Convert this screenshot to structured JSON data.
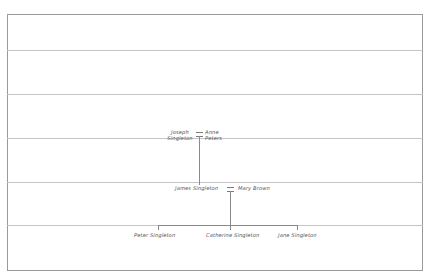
{
  "diagram": {
    "type": "family-tree",
    "generations": [
      {
        "level": 1,
        "couple": {
          "partner_a": {
            "line1": "Joseph",
            "line2": "Singleton",
            "full": "Joseph Singleton"
          },
          "partner_b": {
            "line1": "Anne",
            "line2": "Peters",
            "full": "Anne Peters"
          },
          "symbol": "="
        }
      },
      {
        "level": 2,
        "couple": {
          "partner_a": {
            "full": "James Singleton"
          },
          "partner_b": {
            "full": "Mary Brown"
          },
          "symbol": "="
        }
      },
      {
        "level": 3,
        "children": [
          {
            "full": "Peter Singleton"
          },
          {
            "full": "Catherine Singleton"
          },
          {
            "full": "Jane Singleton"
          }
        ]
      }
    ],
    "rows": 6,
    "colors": {
      "frame": "#9a9a9a",
      "gridline": "#c4c4c4",
      "connector": "#8a8a8a",
      "text": "#555555"
    }
  }
}
